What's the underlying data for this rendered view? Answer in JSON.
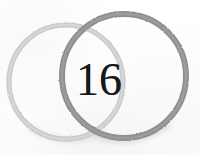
{
  "document": {
    "kind": "scanned-paper-mark",
    "background_color": "#fdfdfd",
    "width": 200,
    "height": 155
  },
  "mark": {
    "numeral": "16",
    "numeral_color": "#181818",
    "rings": [
      {
        "name": "left-ring",
        "color": "#c9c9c9",
        "cx": 66,
        "cy": 82,
        "r": 57,
        "stroke_width": 5.2,
        "tone": "light"
      },
      {
        "name": "right-ring",
        "color": "#8e8e8e",
        "cx": 124,
        "cy": 76,
        "r": 62,
        "stroke_width": 6.0,
        "tone": "dark"
      }
    ],
    "shadow_color": "#b4b4b4"
  }
}
